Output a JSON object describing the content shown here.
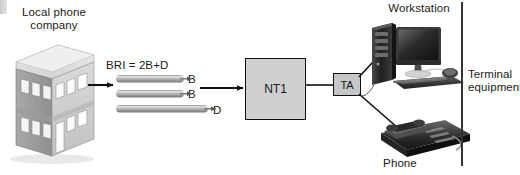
{
  "diagram": {
    "width": 520,
    "height": 175,
    "background": "#ffffff"
  },
  "labels": {
    "local_phone_company": "Local phone\ncompany",
    "bri_formula": "BRI = 2B+D",
    "workstation": "Workstation",
    "phone": "Phone",
    "terminal_equipment": "Terminal\nequipment"
  },
  "nodes": {
    "nt1": {
      "label": "NT1",
      "fill": "#cfcfcf",
      "stroke": "#111111"
    },
    "ta": {
      "label": "TA",
      "fill": "#c6c6c6",
      "stroke": "#111111"
    }
  },
  "channels": [
    {
      "label": "B",
      "type": "bearer"
    },
    {
      "label": "B",
      "type": "bearer"
    },
    {
      "label": "D",
      "type": "delta"
    }
  ],
  "colors": {
    "line": "#111111",
    "pipe_light": "#e8e8e8",
    "pipe_mid": "#9a9a9a",
    "pipe_dark": "#6e6e6e",
    "building_light": "#e4e4e4",
    "building_mid": "#b8b8b8",
    "building_dark": "#8d8d8d",
    "device_dark": "#2b2b2b",
    "device_mid": "#555555",
    "bracket": "#333333",
    "text": "#1a1a1a"
  },
  "connections": [
    {
      "from": "local-phone-company",
      "to": "bri-channels",
      "style": "arrow"
    },
    {
      "from": "bri-channels",
      "to": "nt1",
      "style": "arrow"
    },
    {
      "from": "nt1",
      "to": "ta",
      "style": "line"
    },
    {
      "from": "ta",
      "to": "workstation",
      "style": "line"
    },
    {
      "from": "ta",
      "to": "phone",
      "style": "line"
    }
  ]
}
